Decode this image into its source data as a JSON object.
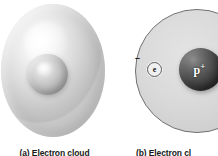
{
  "figure": {
    "background_color": "#ffffff",
    "panels": [
      {
        "id": "a",
        "caption": "(a) Electron cloud",
        "model": "electron-cloud",
        "parts": [
          {
            "name": "electron-cloud-sphere",
            "label": "",
            "color": "#dcdcdc"
          },
          {
            "name": "nucleus-sphere",
            "label": "",
            "color": "#b4b4b4"
          }
        ]
      },
      {
        "id": "b",
        "caption": "(b) Electron cloud",
        "model": "planetary-orbit",
        "parts": [
          {
            "name": "orbit-disc",
            "label": "",
            "color": "#d5d5d5",
            "stroke": "#6f6f6f"
          },
          {
            "name": "electron",
            "label": "e",
            "charge": "–",
            "color": "#f0f0f0"
          },
          {
            "name": "proton-nucleus",
            "label": "p",
            "charge": "+",
            "color": "#3b3b3b"
          }
        ]
      }
    ]
  },
  "panel_a": {
    "caption": "(a) Electron cloud"
  },
  "panel_b": {
    "caption": "(b) Electron cl",
    "electron_symbol": "e",
    "electron_charge": "–",
    "proton_symbol": "p",
    "proton_charge": "+"
  }
}
